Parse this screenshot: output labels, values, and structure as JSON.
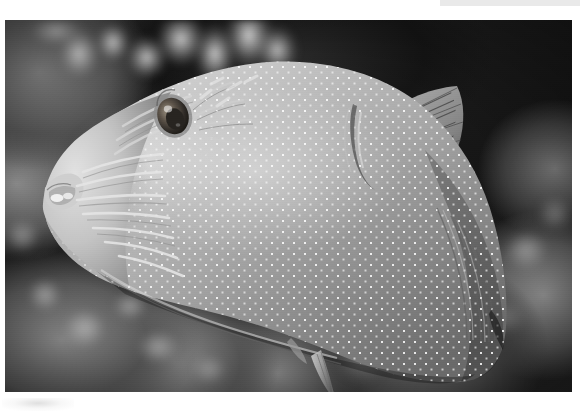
{
  "page": {
    "background_color": "#ffffff",
    "width": 580,
    "height": 411
  },
  "topbar": {
    "name": "header-strip",
    "color": "#e9e9e9",
    "x": 440,
    "y": 0,
    "width": 140,
    "height": 6
  },
  "bottom_smudge": {
    "name": "page-artifact",
    "color": "#b4b4b4",
    "x": 2,
    "y": 398,
    "width": 72,
    "height": 13
  },
  "photo": {
    "name": "underwater-fish-photograph",
    "x": 5,
    "y": 20,
    "width": 567,
    "height": 372,
    "rendering": "grayscale",
    "subject": "white-spotted puffer fish in profile facing left",
    "background_description": "blurred coral reef bokeh, branching pale coral across the top-left, dark water in the upper right",
    "colors": {
      "body_light": "#c9c9c9",
      "body_mid": "#9a9a9a",
      "body_dark": "#6d6d6d",
      "spot": "#fbfbfb",
      "water_dark": "#141414",
      "coral_light": "#e2e2e2"
    },
    "features": [
      {
        "name": "eye",
        "label": "eye",
        "cx": 168,
        "cy": 96
      },
      {
        "name": "snout",
        "label": "snout and mouth",
        "cx": 52,
        "cy": 168
      },
      {
        "name": "pectoral-fin",
        "label": "pectoral fin",
        "cx": 400,
        "cy": 110
      },
      {
        "name": "anal-fin",
        "label": "anal fin",
        "cx": 330,
        "cy": 330
      },
      {
        "name": "caudal-peduncle",
        "label": "caudal peduncle",
        "cx": 480,
        "cy": 300
      },
      {
        "name": "spot-pattern",
        "label": "white spot pattern",
        "cx": 320,
        "cy": 220
      },
      {
        "name": "facial-striping",
        "label": "radiating facial lines",
        "cx": 130,
        "cy": 180
      }
    ]
  }
}
